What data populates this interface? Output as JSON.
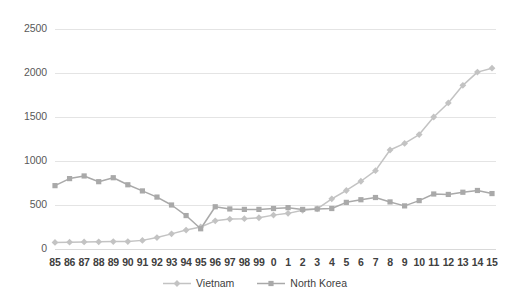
{
  "chart_data": {
    "type": "line",
    "title": "",
    "subtitle": "",
    "xlabel": "",
    "ylabel": "",
    "ylim": [
      0,
      2500
    ],
    "yticks": [
      0,
      500,
      1000,
      1500,
      2000,
      2500
    ],
    "ytick_labels": [
      "0",
      "500",
      "1000",
      "1500",
      "2000",
      "2500"
    ],
    "grid": true,
    "grid_axis": "y",
    "legend_position": "bottom",
    "categories": [
      "85",
      "86",
      "87",
      "88",
      "89",
      "90",
      "91",
      "92",
      "93",
      "94",
      "95",
      "96",
      "97",
      "98",
      "99",
      "0",
      "1",
      "2",
      "3",
      "4",
      "5",
      "6",
      "7",
      "8",
      "9",
      "10",
      "11",
      "12",
      "13",
      "14",
      "15"
    ],
    "series": [
      {
        "name": "Vietnam",
        "color": "#c3c3c3",
        "marker": "diamond",
        "values": [
          75,
          78,
          80,
          82,
          84,
          84,
          98,
          130,
          172,
          215,
          250,
          320,
          340,
          345,
          355,
          385,
          405,
          440,
          455,
          570,
          665,
          770,
          890,
          1125,
          1200,
          1300,
          1500,
          1660,
          1860,
          2010,
          2055
        ]
      },
      {
        "name": "North Korea",
        "color": "#a9a9a9",
        "marker": "square",
        "values": [
          720,
          800,
          830,
          765,
          810,
          730,
          660,
          590,
          500,
          380,
          230,
          480,
          455,
          450,
          450,
          460,
          470,
          450,
          455,
          460,
          530,
          560,
          585,
          535,
          490,
          550,
          625,
          620,
          645,
          665,
          630
        ]
      }
    ]
  },
  "legend": {
    "items": [
      {
        "label": "Vietnam"
      },
      {
        "label": "North Korea"
      }
    ]
  }
}
